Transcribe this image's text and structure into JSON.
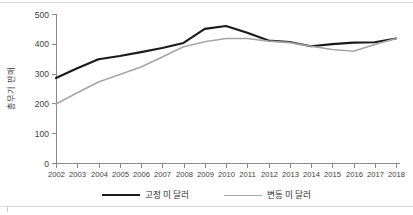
{
  "chart_data": {
    "type": "line",
    "title": "",
    "subtitle": "",
    "xlabel": "",
    "ylabel": "총무기 판매",
    "x": [
      2002,
      2003,
      2004,
      2005,
      2006,
      2007,
      2008,
      2009,
      2010,
      2011,
      2012,
      2013,
      2014,
      2015,
      2016,
      2017,
      2018
    ],
    "categories": [
      "2002",
      "2003",
      "2004",
      "2005",
      "2006",
      "2007",
      "2008",
      "2009",
      "2010",
      "2011",
      "2012",
      "2013",
      "2014",
      "2015",
      "2016",
      "2017",
      "2018"
    ],
    "series": [
      {
        "name": "고정 미 달러",
        "color": "#1a1a1a",
        "width": 2.1,
        "values": [
          285,
          318,
          348,
          359,
          372,
          386,
          403,
          450,
          460,
          437,
          411,
          406,
          392,
          399,
          404,
          405,
          418
        ]
      },
      {
        "name": "변동 미 달러",
        "color": "#a6a6a6",
        "width": 1.6,
        "values": [
          198,
          236,
          272,
          297,
          322,
          356,
          390,
          407,
          418,
          418,
          409,
          404,
          392,
          381,
          375,
          398,
          418
        ]
      }
    ],
    "ylim": [
      0,
      500
    ],
    "yticks": [
      0,
      100,
      200,
      300,
      400,
      500
    ],
    "ytick_labels": [
      "0",
      "100",
      "200",
      "300",
      "400",
      "500"
    ],
    "grid": false,
    "legend_position": "bottom"
  },
  "legend": {
    "items": [
      {
        "label": "고정 미 달러",
        "color": "#1a1a1a",
        "width": "2.1px"
      },
      {
        "label": "변동 미 달러",
        "color": "#a6a6a6",
        "width": "1.6px"
      }
    ]
  },
  "colors": {
    "series_fixed": "#1a1a1a",
    "series_floating": "#a6a6a6",
    "axis": "#8a8a8a",
    "text": "#3d3d3d",
    "rule": "#d8d8d8",
    "background": "#ffffff"
  }
}
